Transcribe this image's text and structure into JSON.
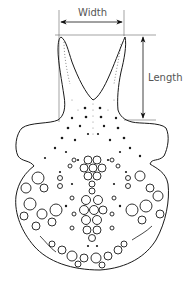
{
  "figure": {
    "type": "scientific line drawing",
    "colors": {
      "line": "#1a1a1a",
      "guide": "#666666",
      "background": "#ffffff"
    }
  },
  "measurements": {
    "width": {
      "label": "Width",
      "orientation": "horizontal"
    },
    "length": {
      "label": "Length",
      "orientation": "vertical"
    }
  }
}
